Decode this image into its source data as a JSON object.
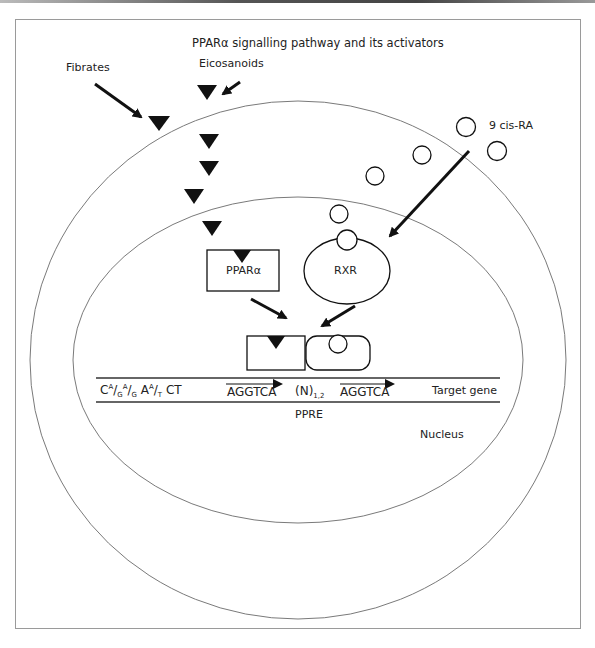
{
  "figure": {
    "title": "PPARα signalling pathway and its activators",
    "labels": {
      "fibrates": "Fibrates",
      "eicosanoids": "Eicosanoids",
      "ligand_9cisra": "9 cis-RA",
      "ppar_alpha": "PPARα",
      "rxr": "RXR",
      "target_gene": "Target gene",
      "ppre": "PPRE",
      "nucleus": "Nucleus"
    },
    "dna_sequence": {
      "consensus_prefix": {
        "c": "C",
        "a1_sup": "A",
        "g1_sub": "G",
        "a2_sup": "A",
        "g2_sub": "G",
        "a3": "A",
        "a4_sup": "A",
        "t_sub": "T",
        "ct": "CT"
      },
      "half_site_1": "AGGTCA",
      "spacer": "(N)",
      "spacer_sub": "1,2",
      "half_site_2": "AGGTCA"
    },
    "colors": {
      "stroke": "#111111",
      "membrane": "#7a7a7a",
      "frame": "#9a9a9a"
    }
  }
}
